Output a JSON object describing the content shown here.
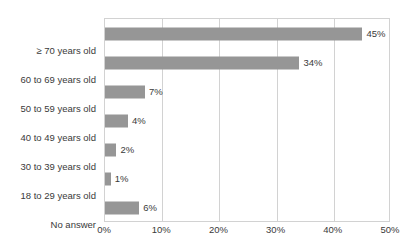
{
  "title_sliver": {
    "left_fragment": "",
    "right_fragment": ""
  },
  "chart_data": {
    "type": "bar",
    "orientation": "horizontal",
    "title": "",
    "xlabel": "",
    "ylabel": "",
    "categories": [
      "≥ 70 years old",
      "60 to 69 years old",
      "50 to 59 years old",
      "40 to 49 years old",
      "30 to 39 years old",
      "18 to 29 years old",
      "No answer"
    ],
    "values": [
      45,
      34,
      7,
      4,
      2,
      1,
      6
    ],
    "value_labels": [
      "45%",
      "34%",
      "7%",
      "4%",
      "2%",
      "1%",
      "6%"
    ],
    "xlim": [
      0,
      50
    ],
    "xticks": [
      0,
      10,
      20,
      30,
      40,
      50
    ],
    "xtick_labels": [
      "0%",
      "10%",
      "20%",
      "30%",
      "40%",
      "50%"
    ],
    "grid": true,
    "grid_axis": "x",
    "legend": false,
    "bar_color": "#969696",
    "grid_color": "#d2d2d2",
    "text_color": "#3a3a3a"
  }
}
